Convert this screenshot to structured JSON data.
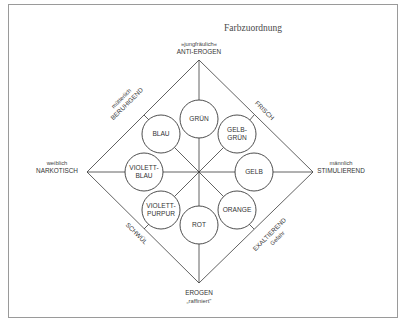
{
  "title": "Farbzuordnung",
  "poles": {
    "top": {
      "line1": "»jungfräulich«",
      "line2": "ANTI-EROGEN"
    },
    "bottom": {
      "line1": "EROGEN",
      "line2": "„raffiniert\""
    },
    "left": {
      "line1": "weiblich",
      "line2": "NARKOTISCH"
    },
    "right": {
      "line1": "männlich",
      "line2": "STIMULIEREND"
    }
  },
  "edges": {
    "top_left": {
      "line1": "mütterlich",
      "line2": "BERUHIGEND"
    },
    "top_right": {
      "line1": "FRISCH"
    },
    "bottom_left": {
      "line1": "SCHWÜL"
    },
    "bottom_right": {
      "line1": "EXALTIEREND",
      "line2": "Gefahr"
    }
  },
  "colors": [
    {
      "id": "gruen",
      "line1": "GRÜN",
      "line2": ""
    },
    {
      "id": "gelbgruen",
      "line1": "GELB-",
      "line2": "GRÜN"
    },
    {
      "id": "gelb",
      "line1": "GELB",
      "line2": ""
    },
    {
      "id": "orange",
      "line1": "ORANGE",
      "line2": ""
    },
    {
      "id": "rot",
      "line1": "ROT",
      "line2": ""
    },
    {
      "id": "violettpurpur",
      "line1": "VIOLETT-",
      "line2": "PURPUR"
    },
    {
      "id": "violettblau",
      "line1": "VIOLETT-",
      "line2": "BLAU"
    },
    {
      "id": "blau",
      "line1": "BLAU",
      "line2": ""
    }
  ]
}
